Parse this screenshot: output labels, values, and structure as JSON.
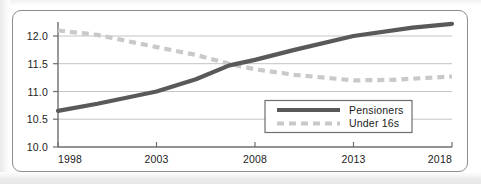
{
  "figure": {
    "frame": {
      "border_color": "#8d8d8d",
      "background_color": "#ffffff"
    }
  },
  "chart_data": {
    "type": "line",
    "title": "",
    "subtitle": "",
    "xlabel": "",
    "ylabel": "",
    "x": [
      1998,
      2003,
      2008,
      2013,
      2018
    ],
    "xlim": [
      1998,
      2018
    ],
    "ylim": [
      10.0,
      12.5
    ],
    "xticks": [
      1998,
      2003,
      2008,
      2013,
      2018
    ],
    "xtick_labels": [
      "1998",
      "2003",
      "2008",
      "2013",
      "2018"
    ],
    "yticks": [
      10.0,
      10.5,
      11.0,
      11.5,
      12.0
    ],
    "ytick_labels": [
      "10.0",
      "10.5",
      "11.0",
      "11.5",
      "12.0"
    ],
    "grid": "horizontal",
    "grid_color": "#c4c4c4",
    "axis_color": "#6e6e6e",
    "legend_position": "center-right-inside",
    "series": [
      {
        "name": "Pensioners",
        "style": "solid",
        "color": "#595959",
        "line_width": 4.2,
        "values": [
          10.65,
          11.0,
          11.57,
          12.0,
          12.22
        ],
        "points": [
          {
            "x": 1998,
            "y": 10.65
          },
          {
            "x": 2000,
            "y": 10.78
          },
          {
            "x": 2003,
            "y": 11.0
          },
          {
            "x": 2005,
            "y": 11.22
          },
          {
            "x": 2006.7,
            "y": 11.47
          },
          {
            "x": 2008,
            "y": 11.57
          },
          {
            "x": 2010,
            "y": 11.75
          },
          {
            "x": 2013,
            "y": 12.0
          },
          {
            "x": 2016,
            "y": 12.15
          },
          {
            "x": 2018,
            "y": 12.22
          }
        ]
      },
      {
        "name": "Under 16s",
        "style": "dashed",
        "color": "#c9c9c9",
        "line_width": 4.2,
        "dash_pattern": "7 5",
        "values": [
          12.1,
          11.8,
          11.4,
          11.2,
          11.27
        ],
        "points": [
          {
            "x": 1998,
            "y": 12.1
          },
          {
            "x": 2000,
            "y": 12.02
          },
          {
            "x": 2003,
            "y": 11.8
          },
          {
            "x": 2005,
            "y": 11.66
          },
          {
            "x": 2006.7,
            "y": 11.5
          },
          {
            "x": 2008,
            "y": 11.4
          },
          {
            "x": 2010,
            "y": 11.3
          },
          {
            "x": 2013,
            "y": 11.2
          },
          {
            "x": 2015,
            "y": 11.21
          },
          {
            "x": 2018,
            "y": 11.27
          }
        ]
      }
    ],
    "annotations": {
      "crossover_year": 2006.7,
      "crossover_value": 11.49
    }
  },
  "legend": {
    "box_border_color": "#6e6e6e",
    "box_background_color": "#ffffff",
    "entries": [
      {
        "label": "Pensioners",
        "swatch": "solid-line-swatch",
        "color": "#595959"
      },
      {
        "label": "Under 16s",
        "swatch": "dashed-line-swatch",
        "color": "#c9c9c9"
      }
    ]
  }
}
